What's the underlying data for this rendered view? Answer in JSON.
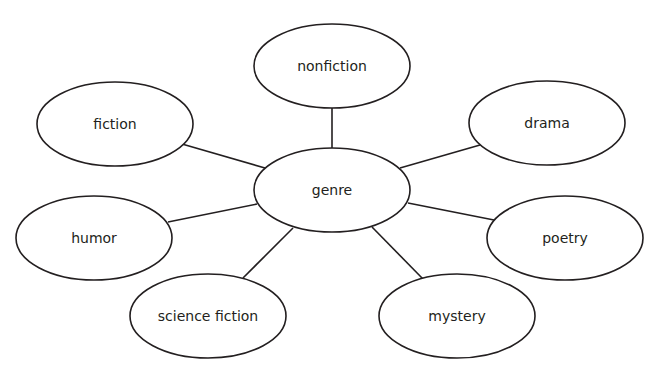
{
  "diagram": {
    "type": "concept-web",
    "center": {
      "id": "genre",
      "label": "genre",
      "cx": 332,
      "cy": 190,
      "rx": 78,
      "ry": 42
    },
    "nodes": [
      {
        "id": "nonfiction",
        "label": "nonfiction",
        "cx": 332,
        "cy": 66,
        "rx": 78,
        "ry": 42
      },
      {
        "id": "fiction",
        "label": "fiction",
        "cx": 115,
        "cy": 124,
        "rx": 78,
        "ry": 42
      },
      {
        "id": "drama",
        "label": "drama",
        "cx": 547,
        "cy": 123,
        "rx": 78,
        "ry": 42
      },
      {
        "id": "humor",
        "label": "humor",
        "cx": 94,
        "cy": 238,
        "rx": 78,
        "ry": 42
      },
      {
        "id": "poetry",
        "label": "poetry",
        "cx": 565,
        "cy": 238,
        "rx": 78,
        "ry": 42
      },
      {
        "id": "science-fiction",
        "label": "science fiction",
        "cx": 208,
        "cy": 316,
        "rx": 78,
        "ry": 42
      },
      {
        "id": "mystery",
        "label": "mystery",
        "cx": 457,
        "cy": 316,
        "rx": 78,
        "ry": 42
      }
    ],
    "edges": [
      {
        "from": "genre",
        "to": "nonfiction",
        "x1": 332,
        "y1": 149,
        "x2": 332,
        "y2": 107
      },
      {
        "from": "genre",
        "to": "fiction",
        "x1": 265,
        "y1": 168,
        "x2": 182,
        "y2": 144
      },
      {
        "from": "genre",
        "to": "drama",
        "x1": 400,
        "y1": 168,
        "x2": 480,
        "y2": 145
      },
      {
        "from": "genre",
        "to": "humor",
        "x1": 257,
        "y1": 204,
        "x2": 168,
        "y2": 222
      },
      {
        "from": "genre",
        "to": "poetry",
        "x1": 408,
        "y1": 203,
        "x2": 494,
        "y2": 220
      },
      {
        "from": "genre",
        "to": "science-fiction",
        "x1": 293,
        "y1": 228,
        "x2": 243,
        "y2": 278
      },
      {
        "from": "genre",
        "to": "mystery",
        "x1": 372,
        "y1": 227,
        "x2": 423,
        "y2": 279
      }
    ]
  }
}
